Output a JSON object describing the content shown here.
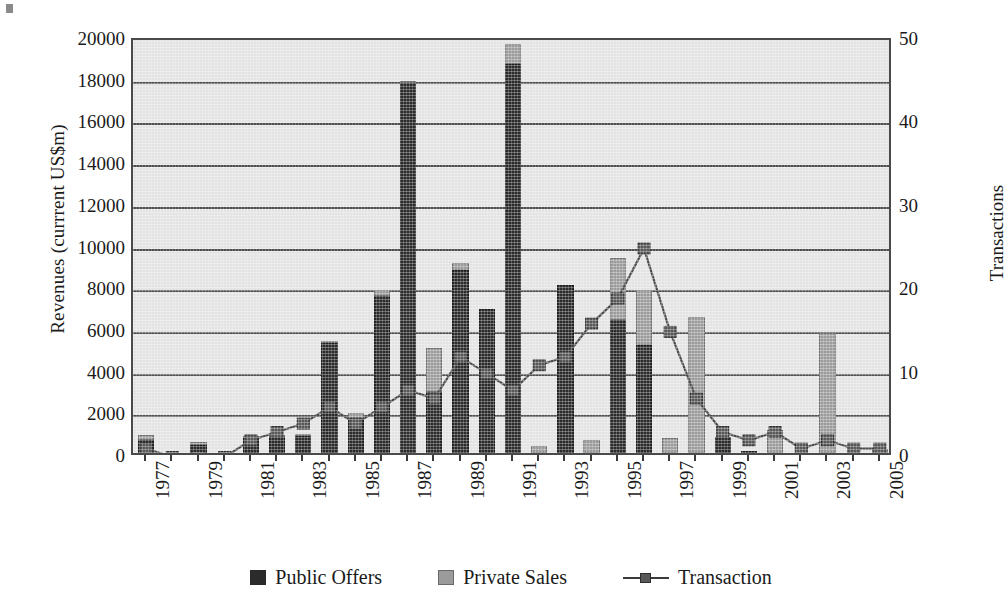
{
  "chart_data": {
    "type": "bar",
    "title": "",
    "subtitle": "",
    "xlabel": "",
    "ylabel": "Revenues (currrent US$m)",
    "y2label": "Transactions",
    "grid": true,
    "legend_position": "bottom",
    "ylim": [
      0,
      20000
    ],
    "y2lim": [
      0,
      50
    ],
    "yticks": [
      0,
      2000,
      4000,
      6000,
      8000,
      10000,
      12000,
      14000,
      16000,
      18000,
      20000
    ],
    "y2ticks": [
      0,
      10,
      20,
      30,
      40,
      50
    ],
    "xtick_labels": [
      "1977",
      "1979",
      "1981",
      "1983",
      "1985",
      "1987",
      "1989",
      "1991",
      "1993",
      "1995",
      "1997",
      "1999",
      "2001",
      "2003",
      "2005"
    ],
    "categories": [
      "1977",
      "1978",
      "1979",
      "1980",
      "1981",
      "1982",
      "1983",
      "1984",
      "1985",
      "1986",
      "1987",
      "1988",
      "1989",
      "1990",
      "1991",
      "1992",
      "1993",
      "1994",
      "1995",
      "1996",
      "1997",
      "1998",
      "1999",
      "2000",
      "2001",
      "2002",
      "2003",
      "2004",
      "2005"
    ],
    "stacked": true,
    "series": [
      {
        "name": "Public Offers",
        "axis": "left",
        "color": "#2b2b2b",
        "values": [
          620,
          0,
          400,
          0,
          700,
          750,
          800,
          5300,
          1650,
          7550,
          17750,
          2950,
          8800,
          6900,
          18650,
          0,
          8050,
          0,
          6400,
          5200,
          0,
          0,
          750,
          100,
          0,
          0,
          0,
          0,
          0
        ]
      },
      {
        "name": "Private Sales",
        "axis": "left",
        "color": "#9b9b9b",
        "values": [
          250,
          0,
          150,
          0,
          120,
          120,
          120,
          60,
          250,
          280,
          50,
          2100,
          300,
          0,
          950,
          320,
          0,
          640,
          2950,
          2600,
          700,
          6500,
          0,
          0,
          1100,
          0,
          5750,
          0,
          180
        ]
      },
      {
        "name": "Transaction",
        "axis": "right",
        "color": "#4a4a4a",
        "marker": "square",
        "values": [
          1,
          0,
          0,
          0,
          2,
          3,
          4,
          6,
          4,
          6,
          8,
          7,
          12,
          10,
          8,
          11,
          12,
          16,
          19,
          25,
          15,
          7,
          3,
          2,
          3,
          1,
          2,
          1,
          1
        ]
      }
    ]
  },
  "legend": {
    "items": [
      {
        "label": "Public Offers",
        "marker": "square-dark"
      },
      {
        "label": "Private Sales",
        "marker": "square-light"
      },
      {
        "label": "Transaction",
        "marker": "line-square"
      }
    ]
  }
}
